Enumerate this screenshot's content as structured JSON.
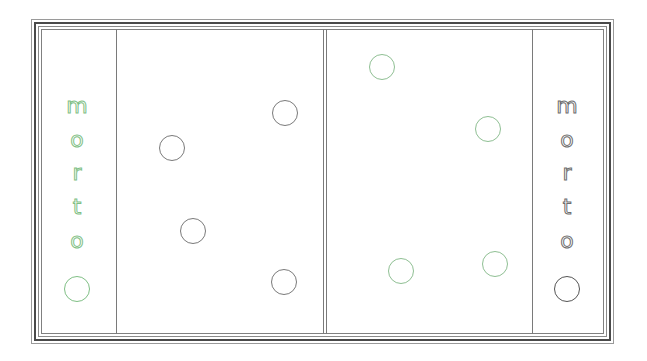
{
  "colors": {
    "green_player": "#7fbf85",
    "gray_player": "#6e6e6e",
    "board_line": "#7a7a7a",
    "frame_dark": "#4a4a4a"
  },
  "left_side": {
    "label_letters": [
      "m",
      "o",
      "r",
      "t",
      "o"
    ],
    "color": "green",
    "reserve_piece": {
      "x": 77,
      "y": 289,
      "color": "green"
    }
  },
  "right_side": {
    "label_letters": [
      "m",
      "o",
      "r",
      "t",
      "o"
    ],
    "color": "gray",
    "reserve_piece": {
      "x": 567,
      "y": 289,
      "color": "gray"
    }
  },
  "board": {
    "left_half_pieces": [
      {
        "x": 285,
        "y": 113,
        "color": "gray"
      },
      {
        "x": 172,
        "y": 148,
        "color": "gray"
      },
      {
        "x": 193,
        "y": 231,
        "color": "gray"
      },
      {
        "x": 284,
        "y": 282,
        "color": "gray"
      }
    ],
    "right_half_pieces": [
      {
        "x": 382,
        "y": 67,
        "color": "green"
      },
      {
        "x": 488,
        "y": 129,
        "color": "green"
      },
      {
        "x": 401,
        "y": 271,
        "color": "green"
      },
      {
        "x": 495,
        "y": 264,
        "color": "green"
      }
    ]
  }
}
